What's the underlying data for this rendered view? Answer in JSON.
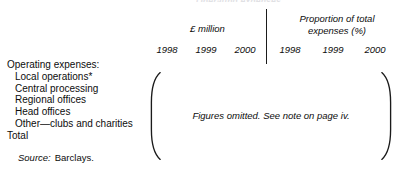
{
  "table": {
    "top_cropped_text": "Operating expenses",
    "column_groups": [
      {
        "label": "£ million"
      },
      {
        "label_line1": "Proportion of total",
        "label_line2": "expenses (%)"
      }
    ],
    "years_money": [
      "1998",
      "1999",
      "2000"
    ],
    "years_proportion": [
      "1998",
      "1999",
      "2000"
    ],
    "rows": [
      {
        "label": "Operating expenses:",
        "indent": false
      },
      {
        "label": "Local operations*",
        "indent": true
      },
      {
        "label": "Central processing",
        "indent": true
      },
      {
        "label": "Regional offices",
        "indent": true
      },
      {
        "label": "Head offices",
        "indent": true
      },
      {
        "label": "Other—clubs and charities",
        "indent": true
      },
      {
        "label": "Total",
        "indent": false
      }
    ],
    "omitted_note": "Figures omitted. See note on page iv.",
    "source_label": "Source:",
    "source_value": "Barclays."
  }
}
